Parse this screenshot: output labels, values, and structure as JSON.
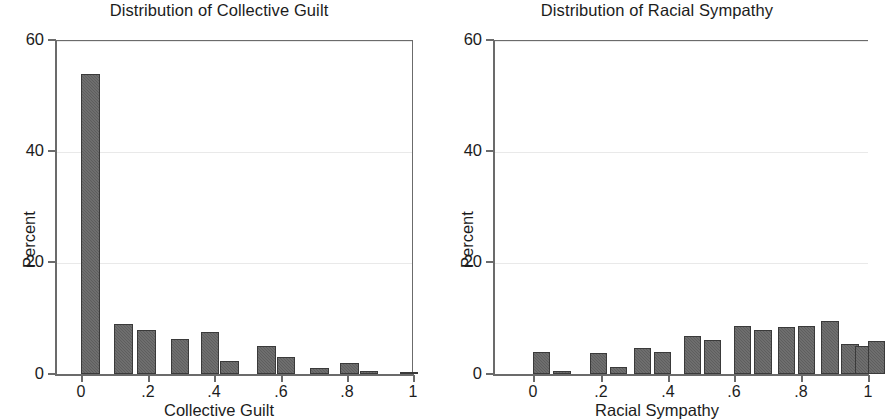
{
  "figure": {
    "panels": [
      {
        "id": "collective-guilt",
        "title": "Distribution of Collective Guilt",
        "xlabel": "Collective Guilt",
        "ylabel": "Percent"
      },
      {
        "id": "racial-sympathy",
        "title": "Distribution of Racial Sympathy",
        "xlabel": "Racial Sympathy",
        "ylabel": "Percent"
      }
    ],
    "yticks": [
      "0",
      "20",
      "40",
      "60"
    ],
    "xticks": [
      "0",
      ".2",
      ".4",
      ".6",
      ".8",
      "1"
    ]
  },
  "chart_data": [
    {
      "type": "bar",
      "title": "Distribution of Collective Guilt",
      "xlabel": "Collective Guilt",
      "ylabel": "Percent",
      "xlim": [
        -0.03,
        1.03
      ],
      "ylim": [
        0,
        62
      ],
      "yticks": [
        0,
        20,
        40,
        60
      ],
      "xticks": [
        0,
        0.2,
        0.4,
        0.6,
        0.8,
        1
      ],
      "grid": "horizontal",
      "legend": "none",
      "bar_color": "#5e5e5e",
      "x": [
        0.0,
        0.1,
        0.17,
        0.27,
        0.36,
        0.42,
        0.53,
        0.59,
        0.69,
        0.78,
        0.84,
        0.96
      ],
      "values": [
        54.0,
        9.0,
        8.0,
        6.3,
        7.6,
        2.4,
        5.0,
        3.0,
        1.1,
        1.9,
        0.6,
        0.3
      ],
      "bin_width": 0.056
    },
    {
      "type": "bar",
      "title": "Distribution of Racial Sympathy",
      "xlabel": "Racial Sympathy",
      "ylabel": "Percent",
      "xlim": [
        -0.03,
        1.03
      ],
      "ylim": [
        0,
        62
      ],
      "yticks": [
        0,
        20,
        40,
        60
      ],
      "xticks": [
        0,
        0.2,
        0.4,
        0.6,
        0.8,
        1
      ],
      "grid": "horizontal",
      "legend": "none",
      "bar_color": "#5e5e5e",
      "x": [
        0.0,
        0.06,
        0.17,
        0.23,
        0.3,
        0.36,
        0.45,
        0.51,
        0.6,
        0.66,
        0.73,
        0.79,
        0.86,
        0.92,
        0.96
      ],
      "values": [
        4.0,
        0.6,
        3.8,
        1.3,
        4.6,
        4.0,
        6.8,
        6.2,
        8.6,
        8.0,
        8.5,
        8.6,
        9.6,
        5.4,
        5.1
      ],
      "extra_x": [
        1.0
      ],
      "extra_values": [
        5.9
      ],
      "bin_width": 0.052
    }
  ]
}
